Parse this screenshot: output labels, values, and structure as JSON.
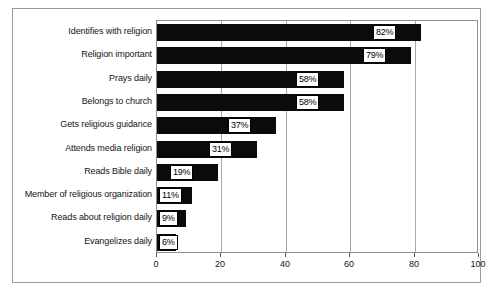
{
  "chart_data": {
    "type": "bar",
    "orientation": "horizontal",
    "title": "",
    "xlabel": "",
    "ylabel": "",
    "xlim": [
      0,
      100
    ],
    "xticks": [
      "0",
      "20",
      "40",
      "60",
      "80",
      "100"
    ],
    "grid": true,
    "legend": "none",
    "categories": [
      "Identifies with religion",
      "Religion important",
      "Prays daily",
      "Belongs to church",
      "Gets religious guidance",
      "Attends media religion",
      "Reads Bible daily",
      "Member of religious organization",
      "Reads about religion daily",
      "Evangelizes daily"
    ],
    "values": [
      82,
      79,
      58,
      58,
      37,
      31,
      19,
      11,
      9,
      6
    ],
    "value_labels": [
      "82%",
      "79%",
      "58%",
      "58%",
      "37%",
      "31%",
      "19%",
      "11%",
      "9%",
      "6%"
    ],
    "colors": {
      "bar": "#0b0b0b",
      "background": "#ffffff",
      "frame": "#9a9a9a",
      "axis": "#8d8d8d",
      "gridline": "#a8a8a8",
      "text": "#141414",
      "value_box_fill": "#ffffff",
      "value_box_border": "#000000"
    }
  }
}
